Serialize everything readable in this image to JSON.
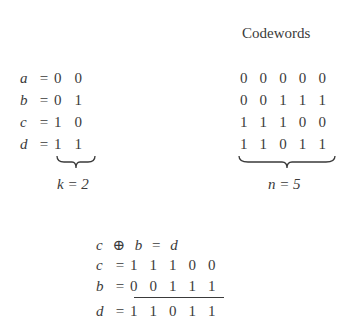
{
  "header": {
    "codewords_title": "Codewords"
  },
  "messages": [
    {
      "var": "a",
      "eq": "=",
      "bits": [
        "0",
        "0"
      ]
    },
    {
      "var": "b",
      "eq": "=",
      "bits": [
        "0",
        "1"
      ]
    },
    {
      "var": "c",
      "eq": "=",
      "bits": [
        "1",
        "0"
      ]
    },
    {
      "var": "d",
      "eq": "=",
      "bits": [
        "1",
        "1"
      ]
    }
  ],
  "k_label": "k = 2",
  "codewords": [
    [
      "0",
      "0",
      "0",
      "0",
      "0"
    ],
    [
      "0",
      "0",
      "1",
      "1",
      "1"
    ],
    [
      "1",
      "1",
      "1",
      "0",
      "0"
    ],
    [
      "1",
      "1",
      "0",
      "1",
      "1"
    ]
  ],
  "n_label": "n = 5",
  "xor_example": {
    "equation": {
      "left": "c",
      "op": "⊕",
      "right": "b",
      "eq": "=",
      "result": "d"
    },
    "rows": [
      {
        "var": "c",
        "eq": "=",
        "bits": [
          "1",
          "1",
          "1",
          "0",
          "0"
        ]
      },
      {
        "var": "b",
        "eq": "=",
        "bits": [
          "0",
          "0",
          "1",
          "1",
          "1"
        ]
      },
      {
        "var": "d",
        "eq": "=",
        "bits": [
          "1",
          "1",
          "0",
          "1",
          "1"
        ]
      }
    ]
  }
}
